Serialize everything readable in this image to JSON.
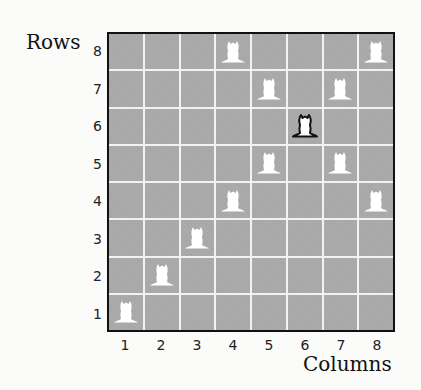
{
  "labels": {
    "rows_title": "Rows",
    "columns_title": "Columns"
  },
  "rows": [
    "8",
    "7",
    "6",
    "5",
    "4",
    "3",
    "2",
    "1"
  ],
  "columns": [
    "1",
    "2",
    "3",
    "4",
    "5",
    "6",
    "7",
    "8"
  ],
  "colors": {
    "board": "#a8a8a8",
    "gridline": "#f2f2f2",
    "piece_white": "#ffffff",
    "piece_highlight_outline": "#111111"
  },
  "pieces": [
    {
      "col": 1,
      "row": 1,
      "style": "white"
    },
    {
      "col": 2,
      "row": 2,
      "style": "white"
    },
    {
      "col": 3,
      "row": 3,
      "style": "white"
    },
    {
      "col": 4,
      "row": 4,
      "style": "white"
    },
    {
      "col": 4,
      "row": 8,
      "style": "white"
    },
    {
      "col": 5,
      "row": 5,
      "style": "white"
    },
    {
      "col": 5,
      "row": 7,
      "style": "white"
    },
    {
      "col": 6,
      "row": 6,
      "style": "outlined"
    },
    {
      "col": 7,
      "row": 5,
      "style": "white"
    },
    {
      "col": 7,
      "row": 7,
      "style": "white"
    },
    {
      "col": 8,
      "row": 4,
      "style": "white"
    },
    {
      "col": 8,
      "row": 8,
      "style": "white"
    }
  ]
}
